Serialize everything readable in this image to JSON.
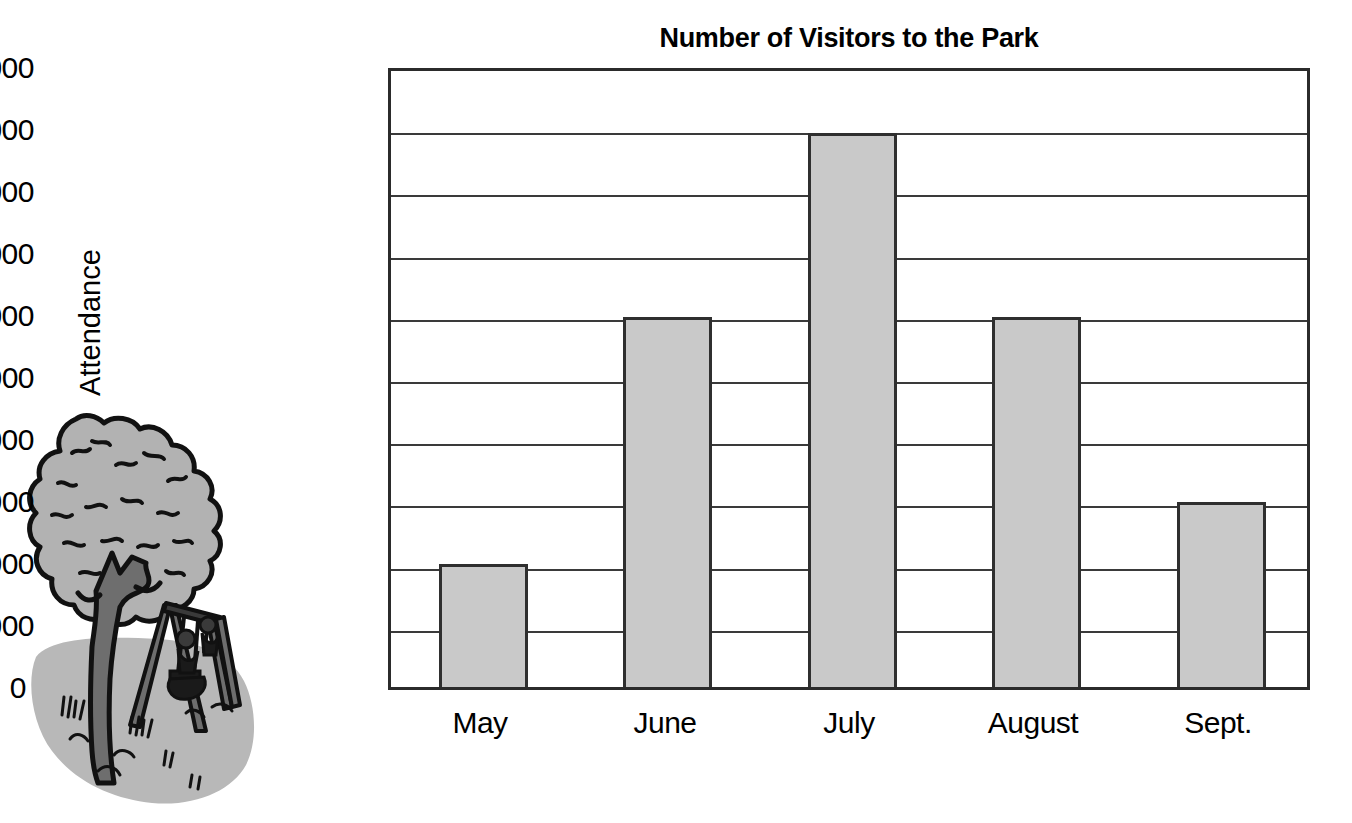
{
  "chart_data": {
    "type": "bar",
    "title": "Number of Visitors to the Park",
    "xlabel": "",
    "ylabel": "Attendance",
    "categories": [
      "May",
      "June",
      "July",
      "August",
      "Sept."
    ],
    "values": [
      8000,
      12000,
      15000,
      12000,
      9000
    ],
    "ylim": [
      6000,
      16000
    ],
    "y_axis_baseline_label": "0",
    "ytick_labels": [
      "16,000",
      "15,000",
      "14,000",
      "13,000",
      "12,000",
      "11,000",
      "10,000",
      "9,000",
      "8,000",
      "7,000"
    ],
    "ytick_values": [
      16000,
      15000,
      14000,
      13000,
      12000,
      11000,
      10000,
      9000,
      8000,
      7000
    ],
    "grid": true,
    "legend": "none",
    "bar_fill_color": "#c9c9c9",
    "bar_edge_color": "#2f2f2f",
    "axis_color": "#2b2b2b",
    "background_color": "#ffffff"
  },
  "illustration": {
    "name": "park-tree-and-swing-set",
    "foliage_color": "#b2b2b2",
    "trunk_color": "#6e6e6e",
    "ground_color": "#b8b8b8",
    "outline_color": "#111111"
  }
}
